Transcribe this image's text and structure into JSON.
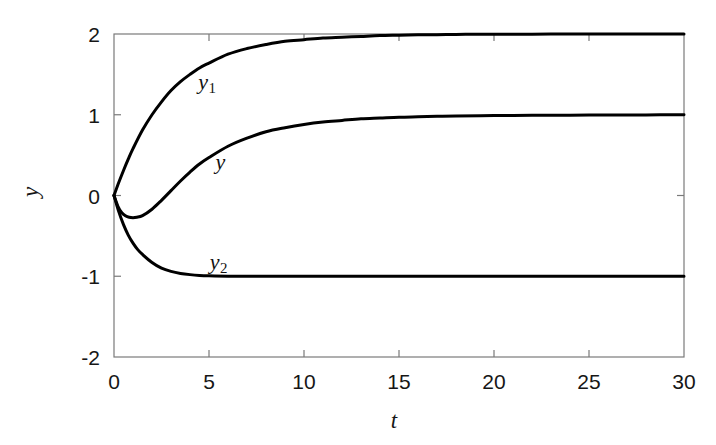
{
  "chart_data": {
    "type": "line",
    "title": "",
    "xlabel": "t",
    "ylabel": "y",
    "xlim": [
      0,
      30
    ],
    "ylim": [
      -2,
      2
    ],
    "xticks": [
      0,
      5,
      10,
      15,
      20,
      25,
      30
    ],
    "yticks": [
      2,
      1,
      0,
      -1,
      -2
    ],
    "xtick_labels": [
      "0",
      "5",
      "10",
      "15",
      "20",
      "25",
      "30"
    ],
    "ytick_labels": [
      "2",
      "1",
      "0",
      "-1",
      "-2"
    ],
    "grid": false,
    "legend": "inline-annotations",
    "line_color": "#000000",
    "background": "#ffffff",
    "series": [
      {
        "name": "y1",
        "label": "y",
        "label_sub": "1",
        "label_x": 4.9,
        "label_y": 1.38,
        "description": "Rises monotonically from 0 to steady state 2",
        "x": [
          0,
          0.25,
          0.5,
          0.75,
          1,
          1.5,
          2,
          2.5,
          3,
          3.5,
          4,
          4.5,
          5,
          6,
          7,
          8,
          9,
          10,
          11,
          12,
          13,
          14,
          15,
          16,
          17,
          18,
          19,
          20,
          22,
          24,
          26,
          28,
          30
        ],
        "values": [
          0,
          0.16,
          0.31,
          0.45,
          0.58,
          0.81,
          1.0,
          1.16,
          1.3,
          1.41,
          1.5,
          1.58,
          1.64,
          1.75,
          1.82,
          1.87,
          1.91,
          1.93,
          1.95,
          1.96,
          1.97,
          1.98,
          1.985,
          1.99,
          1.992,
          1.995,
          1.996,
          1.997,
          1.998,
          1.999,
          2.0,
          2.0,
          2.0
        ]
      },
      {
        "name": "y",
        "label": "y",
        "label_sub": "",
        "label_x": 5.6,
        "label_y": 0.42,
        "description": "Dips to about -0.27 near t=1.1 then rises to steady state 1",
        "x": [
          0,
          0.2,
          0.4,
          0.6,
          0.8,
          1.0,
          1.2,
          1.5,
          2,
          2.5,
          3,
          3.5,
          4,
          4.5,
          5,
          6,
          7,
          8,
          9,
          10,
          11,
          12,
          13,
          14,
          15,
          16,
          17,
          18,
          20,
          22,
          24,
          26,
          28,
          30
        ],
        "values": [
          0,
          -0.13,
          -0.21,
          -0.25,
          -0.27,
          -0.275,
          -0.27,
          -0.25,
          -0.17,
          -0.06,
          0.06,
          0.18,
          0.29,
          0.39,
          0.47,
          0.61,
          0.71,
          0.79,
          0.84,
          0.88,
          0.91,
          0.93,
          0.95,
          0.96,
          0.97,
          0.975,
          0.98,
          0.985,
          0.99,
          0.993,
          0.995,
          0.997,
          0.998,
          1.0
        ],
        "min_value": -0.275,
        "min_at_t": 1.05
      },
      {
        "name": "y2",
        "label": "y",
        "label_sub": "2",
        "label_x": 5.5,
        "label_y": -0.85,
        "description": "Falls monotonically from 0 to steady state -1",
        "x": [
          0,
          0.25,
          0.5,
          0.75,
          1,
          1.25,
          1.5,
          2,
          2.5,
          3,
          3.5,
          4,
          4.5,
          5,
          6,
          7,
          8,
          10,
          12,
          15,
          20,
          25,
          30
        ],
        "values": [
          0,
          -0.2,
          -0.36,
          -0.49,
          -0.59,
          -0.67,
          -0.73,
          -0.83,
          -0.9,
          -0.94,
          -0.965,
          -0.98,
          -0.99,
          -0.995,
          -1.0,
          -1.0,
          -1.0,
          -1.0,
          -1.0,
          -1.0,
          -1.0,
          -1.0,
          -1.0
        ]
      }
    ]
  }
}
